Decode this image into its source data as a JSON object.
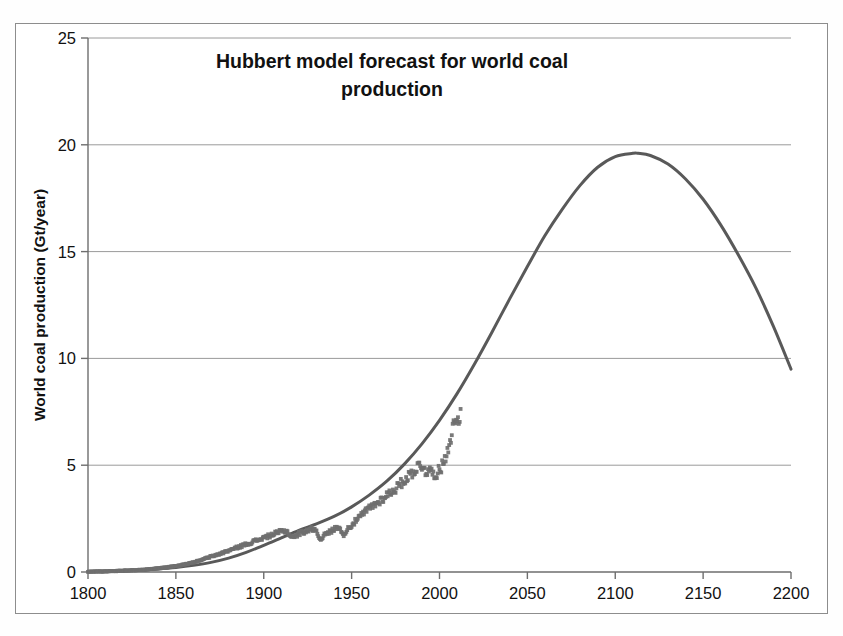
{
  "chart_data": {
    "type": "line",
    "title": "Hubbert model forecast for world coal production",
    "title_line1": "Hubbert model forecast for world coal",
    "title_line2": "production",
    "xlabel": "",
    "ylabel": "World coal production (Gt/year)",
    "xlim": [
      1800,
      2200
    ],
    "ylim": [
      0,
      25
    ],
    "xticks": [
      1800,
      1850,
      1900,
      1950,
      2000,
      2050,
      2100,
      2150,
      2200
    ],
    "xtick_labels": [
      "1800",
      "1850",
      "1900",
      "1950",
      "2000",
      "2050",
      "2100",
      "2150",
      "2200"
    ],
    "yticks": [
      0,
      5,
      10,
      15,
      20,
      25
    ],
    "ytick_labels": [
      "0",
      "5",
      "10",
      "15",
      "20",
      "25"
    ],
    "grid": "horizontal",
    "legend": "none",
    "units": "Gt/year",
    "peak_year": 2113,
    "peak_value": 19.6,
    "value_at_2200": 9.5,
    "colors": {
      "curve": "#595959",
      "data_points": "#6f6f6f",
      "gridline": "#9a9a9a",
      "axis": "#6e6e6e",
      "frame": "#8d8d8d",
      "text": "#111111",
      "background": "#ffffff"
    },
    "series": [
      {
        "name": "Hubbert model forecast",
        "style": "smooth-curve",
        "x": [
          1800,
          1810,
          1820,
          1830,
          1840,
          1850,
          1860,
          1870,
          1880,
          1890,
          1900,
          1910,
          1920,
          1930,
          1940,
          1950,
          1960,
          1970,
          1980,
          1990,
          2000,
          2010,
          2020,
          2030,
          2040,
          2050,
          2060,
          2070,
          2080,
          2090,
          2100,
          2110,
          2113,
          2120,
          2130,
          2140,
          2150,
          2160,
          2170,
          2180,
          2190,
          2200
        ],
        "values": [
          0.02,
          0.04,
          0.06,
          0.09,
          0.14,
          0.21,
          0.31,
          0.45,
          0.65,
          0.92,
          1.25,
          1.6,
          1.95,
          2.25,
          2.6,
          3.05,
          3.6,
          4.25,
          5.05,
          6.0,
          7.1,
          8.35,
          9.75,
          11.25,
          12.8,
          14.3,
          15.75,
          17.0,
          18.1,
          18.95,
          19.45,
          19.6,
          19.6,
          19.5,
          19.1,
          18.4,
          17.45,
          16.25,
          14.85,
          13.3,
          11.5,
          9.5
        ]
      },
      {
        "name": "Historical world coal production data",
        "style": "noisy-markers",
        "x": [
          1800,
          1805,
          1810,
          1815,
          1820,
          1825,
          1830,
          1835,
          1840,
          1845,
          1850,
          1855,
          1860,
          1865,
          1870,
          1875,
          1880,
          1885,
          1890,
          1895,
          1900,
          1905,
          1910,
          1913,
          1915,
          1918,
          1920,
          1925,
          1929,
          1932,
          1935,
          1938,
          1940,
          1943,
          1945,
          1947,
          1950,
          1955,
          1960,
          1965,
          1970,
          1975,
          1980,
          1985,
          1988,
          1990,
          1992,
          1995,
          1998,
          2000,
          2002,
          2004,
          2006,
          2008,
          2010,
          2012
        ],
        "values": [
          0.01,
          0.02,
          0.03,
          0.04,
          0.06,
          0.08,
          0.1,
          0.13,
          0.17,
          0.22,
          0.28,
          0.35,
          0.45,
          0.58,
          0.72,
          0.85,
          1.0,
          1.15,
          1.3,
          1.45,
          1.6,
          1.75,
          1.9,
          1.92,
          1.7,
          1.65,
          1.8,
          1.95,
          2.05,
          1.55,
          1.75,
          1.9,
          2.0,
          2.15,
          1.7,
          1.95,
          2.2,
          2.6,
          3.0,
          3.25,
          3.6,
          3.9,
          4.3,
          4.7,
          4.95,
          5.0,
          4.75,
          4.7,
          4.6,
          4.75,
          5.05,
          5.6,
          6.2,
          6.85,
          7.2,
          7.45
        ]
      }
    ]
  }
}
